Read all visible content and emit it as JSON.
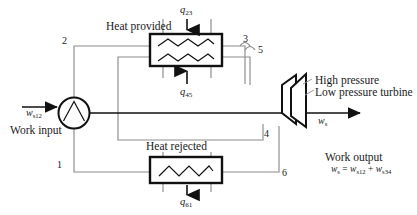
{
  "diagram": {
    "title_semantic": "reheat-rankine-cycle-schematic",
    "labels": {
      "heat_provided": "Heat provided",
      "heat_rejected": "Heat rejected",
      "work_input": "Work input",
      "work_output": "Work output",
      "high_pressure": "High pressure",
      "low_pressure_turbine": "Low pressure turbine"
    },
    "flow_symbols": {
      "q23_base": "q",
      "q23_sub": "23",
      "q45_base": "q",
      "q45_sub": "45",
      "q61_base": "q",
      "q61_sub": "61",
      "ws12_base": "w",
      "ws12_sub": "s12",
      "ws_base": "w",
      "ws_sub": "s"
    },
    "equation": {
      "lhs_base": "w",
      "lhs_sub": "s",
      "eq": " = ",
      "term1_base": "w",
      "term1_sub": "s12",
      "plus": " + ",
      "term2_base": "w",
      "term2_sub": "s34"
    },
    "state_points": [
      {
        "id": "1",
        "label": "1"
      },
      {
        "id": "2",
        "label": "2"
      },
      {
        "id": "3",
        "label": "3"
      },
      {
        "id": "4",
        "label": "4"
      },
      {
        "id": "5",
        "label": "5"
      },
      {
        "id": "6",
        "label": "6"
      }
    ],
    "components": [
      {
        "name": "pump",
        "label": "pump-circle"
      },
      {
        "name": "boiler-reheater",
        "label": "heat-exchanger-upper"
      },
      {
        "name": "condenser",
        "label": "heat-exchanger-lower"
      },
      {
        "name": "hp-turbine",
        "label": "turbine-high-pressure"
      },
      {
        "name": "lp-turbine",
        "label": "turbine-low-pressure"
      }
    ],
    "colors": {
      "line": "#8c8c8c",
      "heavy": "#111111",
      "text": "#1a1a1a",
      "background": "#ffffff"
    }
  }
}
